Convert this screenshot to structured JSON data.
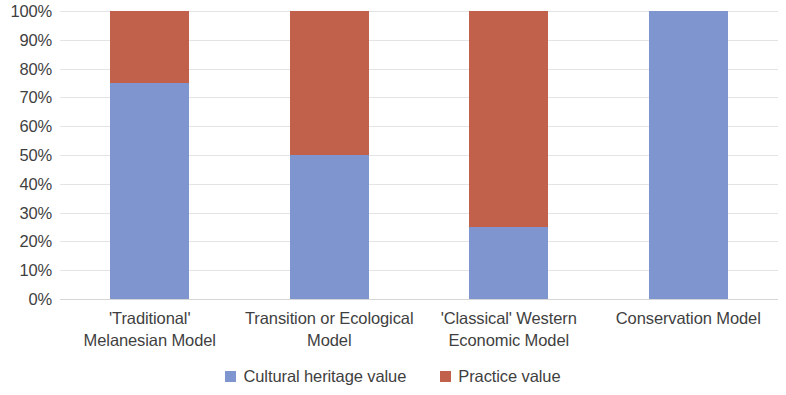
{
  "chart_data": {
    "type": "bar",
    "subtype": "stacked-100-percent",
    "title": "",
    "xlabel": "",
    "ylabel": "",
    "ylim": [
      0,
      100
    ],
    "ytick_labels": [
      "100%",
      "90%",
      "80%",
      "70%",
      "60%",
      "50%",
      "40%",
      "30%",
      "20%",
      "10%",
      "0%"
    ],
    "ytick_values": [
      100,
      90,
      80,
      70,
      60,
      50,
      40,
      30,
      20,
      10,
      0
    ],
    "grid": true,
    "legend_position": "bottom-center",
    "categories": [
      "'Traditional' Melanesian Model",
      "Transition or Ecological Model",
      "'Classical' Western Economic Model",
      "Conservation Model"
    ],
    "category_lines": [
      [
        "'Traditional'",
        "Melanesian Model"
      ],
      [
        "Transition or Ecological",
        "Model"
      ],
      [
        "'Classical' Western",
        "Economic Model"
      ],
      [
        "Conservation Model"
      ]
    ],
    "series": [
      {
        "name": "Cultural heritage value",
        "color": "#7E95CF",
        "values": [
          75,
          50,
          25,
          100
        ]
      },
      {
        "name": "Practice value",
        "color": "#C1604B",
        "values": [
          25,
          50,
          75,
          0
        ]
      }
    ]
  },
  "colors": {
    "cultural_heritage_value": "#7E95CF",
    "practice_value": "#C1604B",
    "gridline": "#e4e4e4",
    "axis": "#d6d6d6",
    "text": "#3f3f3f",
    "background": "#ffffff"
  },
  "legend": {
    "items": [
      {
        "label": "Cultural heritage value",
        "color": "#7E95CF",
        "swatch": "blue-square-icon"
      },
      {
        "label": "Practice value",
        "color": "#C1604B",
        "swatch": "red-square-icon"
      }
    ]
  }
}
